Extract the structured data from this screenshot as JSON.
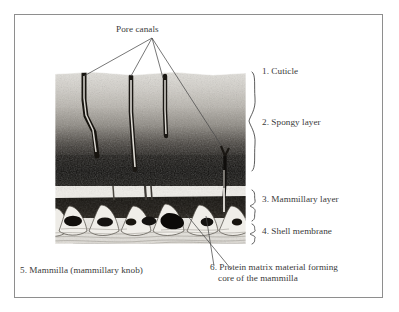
{
  "figure": {
    "title_annotation": "Pore canals",
    "border_color": "#8e8e8e",
    "background_color": "#ffffff",
    "text_color": "#3a3a3a"
  },
  "labels": [
    {
      "id": "1",
      "text": "1. Cuticle"
    },
    {
      "id": "2",
      "text": "2. Spongy layer"
    },
    {
      "id": "3",
      "text": "3. Mammillary layer"
    },
    {
      "id": "4",
      "text": "4. Shell membrane"
    },
    {
      "id": "5",
      "text": "5. Mammilla (mammillary knob)"
    },
    {
      "id": "6",
      "text": "6. Protein matrix material forming",
      "text_line2": "core of the mammilla"
    }
  ],
  "micrograph": {
    "description": "grayscale cross-section micrograph of avian eggshell",
    "layers": [
      {
        "name": "cuticle",
        "tone": "#d9d7d2"
      },
      {
        "name": "spongy-layer",
        "tone": "#8a8782"
      },
      {
        "name": "spongy-layer-dense",
        "tone": "#1c1a18"
      },
      {
        "name": "mammillary-layer",
        "tone": "#14120f"
      },
      {
        "name": "shell-membrane",
        "tone": "#e3e1dc"
      }
    ],
    "pore_canal_count": 4,
    "mammilla_count": 6
  }
}
